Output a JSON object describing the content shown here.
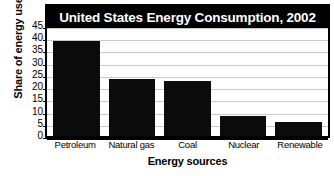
{
  "chart_data": {
    "type": "bar",
    "title": "United States Energy Consumption, 2002",
    "xlabel": "Energy sources",
    "ylabel": "Share of energy use",
    "categories": [
      "Petroleum",
      "Natural gas",
      "Coal",
      "Nuclear",
      "Renewable"
    ],
    "values": [
      39,
      23.5,
      22.5,
      8,
      5.7
    ],
    "ylim": [
      0,
      45
    ],
    "ytick_labels": [
      "45",
      "40",
      "35",
      "30",
      "25",
      "20",
      "15",
      "10",
      "5",
      "0"
    ],
    "ytick_values": [
      45,
      40,
      35,
      30,
      25,
      20,
      15,
      10,
      5,
      0
    ],
    "grid": true,
    "legend": false,
    "series": [
      {
        "name": "Share of energy use",
        "values": [
          39,
          23.5,
          22.5,
          8,
          5.7
        ]
      }
    ],
    "colors": {
      "bar": "#0b0b0b",
      "title_background": "#000000",
      "title_text": "#ffffff",
      "gridline": "#c9c9c9",
      "axis": "#000000",
      "plot_background": "#ffffff"
    }
  }
}
